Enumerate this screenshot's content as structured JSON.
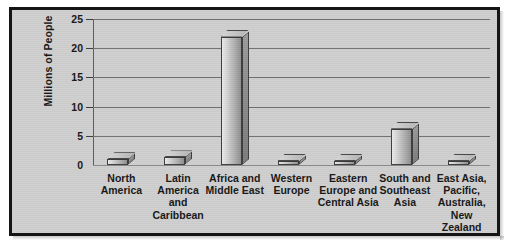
{
  "chart_data": {
    "type": "bar",
    "title": "",
    "xlabel": "",
    "ylabel": "Millions of People",
    "ylim": [
      0,
      25
    ],
    "yticks": [
      0,
      5,
      10,
      15,
      20,
      25
    ],
    "ytick_labels": [
      "0",
      "5",
      "10",
      "15",
      "20",
      "25"
    ],
    "grid": true,
    "legend": false,
    "categories": [
      "North America",
      "Latin America and Caribbean",
      "Africa and Middle East",
      "Western Europe",
      "Eastern Europe and Central Asia",
      "South and Southeast Asia",
      "East Asia, Pacific, Australia, New Zealand"
    ],
    "category_lines": [
      [
        "North",
        "America"
      ],
      [
        "Latin",
        "America",
        "and",
        "Caribbean"
      ],
      [
        "Africa and",
        "Middle East"
      ],
      [
        "Western",
        "Europe"
      ],
      [
        "Eastern",
        "Europe and",
        "Central Asia"
      ],
      [
        "South and",
        "Southeast",
        "Asia"
      ],
      [
        "East Asia,",
        "Pacific,",
        "Australia,",
        "New",
        "Zealand"
      ]
    ],
    "values": [
      1.0,
      1.3,
      22.0,
      0.6,
      0.4,
      6.2,
      0.5
    ],
    "value_labels": [
      "1.0",
      "1.3",
      "22.0",
      "0.6",
      "0.4",
      "6.2",
      "0.5"
    ],
    "style": "3d-bar",
    "colors": {
      "background": "#cfcfcf",
      "frame": "#151515",
      "bar_light": "#e9e9e9",
      "bar_dark": "#8e8e8e",
      "bar_edge": "#3c3c3c",
      "gridline": "#6f6f6f",
      "text": "#161616"
    }
  }
}
